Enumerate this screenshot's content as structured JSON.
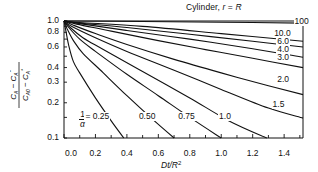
{
  "chart_data": {
    "type": "line",
    "title": "Cylinder, r = R",
    "xlabel": "Dt/R²",
    "ylabel": "(C_A − C_A*) / (C_A0 − C_A*)",
    "xlim": [
      0.0,
      1.52
    ],
    "ylim": [
      0.1,
      1.0
    ],
    "yscale": "log",
    "grid": false,
    "legend": "inline curve labels",
    "x_ticks": [
      "0.0",
      "0.2",
      "0.4",
      "0.6",
      "0.8",
      "1.0",
      "1.2",
      "1.4"
    ],
    "y_ticks": [
      "1.0",
      "0.8",
      "0.6",
      "0.4",
      "0.3",
      "0.2",
      "0.1"
    ],
    "parameter_label": "1/α",
    "series": [
      {
        "name": "0.25",
        "x": [
          0,
          0.01,
          0.03,
          0.06,
          0.1,
          0.2,
          0.3,
          0.38
        ],
        "y": [
          1.0,
          0.85,
          0.62,
          0.45,
          0.36,
          0.22,
          0.14,
          0.1
        ]
      },
      {
        "name": "0.50",
        "x": [
          0,
          0.02,
          0.06,
          0.12,
          0.25,
          0.4,
          0.55,
          0.7
        ],
        "y": [
          1.0,
          0.86,
          0.68,
          0.53,
          0.36,
          0.23,
          0.15,
          0.1
        ]
      },
      {
        "name": "0.75",
        "x": [
          0,
          0.03,
          0.1,
          0.2,
          0.4,
          0.6,
          0.8,
          1.0
        ],
        "y": [
          1.0,
          0.88,
          0.7,
          0.55,
          0.35,
          0.23,
          0.15,
          0.1
        ]
      },
      {
        "name": "1.0",
        "x": [
          0,
          0.04,
          0.12,
          0.25,
          0.5,
          0.8,
          1.05,
          1.29
        ],
        "y": [
          1.0,
          0.88,
          0.72,
          0.57,
          0.37,
          0.22,
          0.14,
          0.1
        ]
      },
      {
        "name": "1.5",
        "x": [
          0,
          0.05,
          0.2,
          0.4,
          0.7,
          1.0,
          1.3,
          1.52
        ],
        "y": [
          1.0,
          0.9,
          0.72,
          0.55,
          0.38,
          0.26,
          0.18,
          0.148
        ]
      },
      {
        "name": "2.0",
        "x": [
          0,
          0.06,
          0.2,
          0.4,
          0.7,
          1.0,
          1.3,
          1.52
        ],
        "y": [
          1.0,
          0.92,
          0.78,
          0.63,
          0.47,
          0.36,
          0.28,
          0.235
        ]
      },
      {
        "name": "3.0",
        "x": [
          0,
          0.08,
          0.3,
          0.6,
          0.9,
          1.2,
          1.52
        ],
        "y": [
          1.0,
          0.94,
          0.82,
          0.68,
          0.57,
          0.48,
          0.4
        ]
      },
      {
        "name": "4.0",
        "x": [
          0,
          0.1,
          0.4,
          0.8,
          1.2,
          1.52
        ],
        "y": [
          1.0,
          0.95,
          0.83,
          0.7,
          0.58,
          0.49
        ]
      },
      {
        "name": "6.0",
        "x": [
          0,
          0.1,
          0.4,
          0.8,
          1.2,
          1.52
        ],
        "y": [
          1.0,
          0.96,
          0.88,
          0.77,
          0.67,
          0.6
        ]
      },
      {
        "name": "10.0",
        "x": [
          0,
          0.1,
          0.5,
          1.0,
          1.52
        ],
        "y": [
          1.0,
          0.97,
          0.9,
          0.78,
          0.67
        ]
      },
      {
        "name": "100",
        "x": [
          0,
          0.5,
          1.0,
          1.52
        ],
        "y": [
          1.0,
          0.99,
          0.975,
          0.96
        ]
      }
    ],
    "labels": [
      {
        "text": "100",
        "x": 1.46,
        "y": 0.985
      },
      {
        "text": "10.0",
        "x": 1.33,
        "y": 0.78
      },
      {
        "text": "6.0",
        "x": 1.35,
        "y": 0.66
      },
      {
        "text": "4.0",
        "x": 1.35,
        "y": 0.57
      },
      {
        "text": "3.0",
        "x": 1.35,
        "y": 0.48
      },
      {
        "text": "2.0",
        "x": 1.35,
        "y": 0.315
      },
      {
        "text": "1.5",
        "x": 1.32,
        "y": 0.19
      },
      {
        "text": "1.0",
        "x": 0.98,
        "y": 0.15
      },
      {
        "text": "0.75",
        "x": 0.72,
        "y": 0.15
      },
      {
        "text": "0.50",
        "x": 0.47,
        "y": 0.15
      },
      {
        "text": "= 0.25",
        "x": 0.13,
        "y": 0.15
      }
    ]
  },
  "text": {
    "title_prefix": "Cylinder, ",
    "title_var": "r",
    "title_eq": " = ",
    "title_var2": "R",
    "xlabel_main": "Dt/R",
    "xlabel_sup": "2",
    "ylabel_num": "C_A − C_A*",
    "ylabel_den": "C_A0 − C_A*",
    "alpha_num": "1",
    "alpha_den": "α"
  },
  "colors": {
    "line": "#111111",
    "axis": "#111111",
    "background": "#ffffff"
  }
}
